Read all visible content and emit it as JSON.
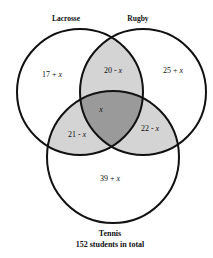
{
  "diagram": {
    "type": "venn",
    "sets": [
      {
        "id": "lacrosse",
        "label": "Lacrosse"
      },
      {
        "id": "rugby",
        "label": "Rugby"
      },
      {
        "id": "tennis",
        "label": "Tennis"
      }
    ],
    "regions": {
      "lacrosse_only": {
        "num": "17 + ",
        "var": "x"
      },
      "rugby_only": {
        "num": "25 + ",
        "var": "x"
      },
      "tennis_only": {
        "num": "39 + ",
        "var": "x"
      },
      "lacrosse_rugby": {
        "num": "20 - ",
        "var": "x"
      },
      "lacrosse_tennis": {
        "num": "21 - ",
        "var": "x"
      },
      "rugby_tennis": {
        "num": "22 - ",
        "var": "x"
      },
      "all_three": {
        "num": "",
        "var": "x"
      }
    },
    "total_label": "152 students in total",
    "colors": {
      "outline": "#111111",
      "pair_shade": "#d4d4d4",
      "triple_shade": "#9a9a9a",
      "background": "#ffffff"
    }
  }
}
